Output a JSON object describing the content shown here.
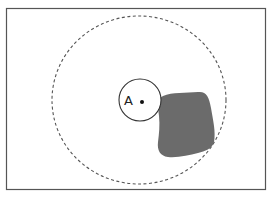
{
  "diagram": {
    "point_label": "A",
    "colors": {
      "frame": "#555555",
      "outer_circle": "#555555",
      "inner_circle": "#333333",
      "blob_fill": "#6b6b6b",
      "background": "#ffffff"
    },
    "elements": [
      {
        "type": "frame",
        "description": "rectangular border"
      },
      {
        "type": "dashed-circle",
        "description": "large dashed circle centered near point A"
      },
      {
        "type": "solid-circle",
        "description": "small solid circle around point A"
      },
      {
        "type": "point",
        "label": "A"
      },
      {
        "type": "blob",
        "description": "grey irregular shaded region to the right of point A"
      }
    ]
  }
}
